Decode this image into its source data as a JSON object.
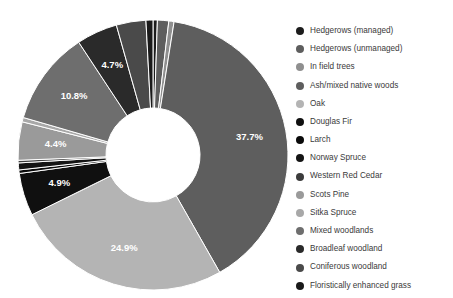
{
  "chart_data": {
    "type": "pie",
    "variant": "donut",
    "title": "",
    "subtitle": "",
    "xlabel": "",
    "ylabel": "",
    "grid": false,
    "legend_position": "right",
    "start_angle_deg": 0,
    "direction": "clockwise",
    "inner_radius_ratio": 0.35,
    "units": "percent",
    "total": 100.0,
    "categories": [
      "Hedgerows (managed)",
      "Hedgerows (unmanaged)",
      "In field trees",
      "Ash/mixed native woods",
      "Oak",
      "Douglas Fir",
      "Larch",
      "Norway Spruce",
      "Western Red Cedar",
      "Scots Pine",
      "Sitka Spruce",
      "Mixed woodlands",
      "Broadleaf woodland",
      "Coniferous woodland",
      "Floristically enhanced grass"
    ],
    "values": [
      0.5,
      1.3,
      0.6,
      37.7,
      24.9,
      4.9,
      0.4,
      0.8,
      0.3,
      4.4,
      0.5,
      10.8,
      4.7,
      3.4,
      0.8
    ],
    "colors": [
      "#1c1c1c",
      "#5e5e5e",
      "#8f8f8f",
      "#5e5e5e",
      "#b4b4b4",
      "#101010",
      "#0a0a0a",
      "#141414",
      "#3c3c3c",
      "#9a9a9a",
      "#a8a8a8",
      "#6e6e6e",
      "#2a2a2a",
      "#4a4a4a",
      "#1a1a1a"
    ],
    "visible_data_labels": [
      {
        "label": "37.7%",
        "value": 37.7,
        "category": "Ash/mixed native woods"
      },
      {
        "label": "24.9%",
        "value": 24.9,
        "category": "Oak"
      },
      {
        "label": "4.9%",
        "value": 4.9,
        "category": "Douglas Fir"
      },
      {
        "label": "4.4%",
        "value": 4.4,
        "category": "Scots Pine"
      },
      {
        "label": "10.8%",
        "value": 10.8,
        "category": "Mixed woodlands"
      },
      {
        "label": "4.7%",
        "value": 4.7,
        "category": "Broadleaf woodland"
      }
    ]
  },
  "legend": {
    "items": [
      {
        "label": "Hedgerows (managed)",
        "color": "#1c1c1c"
      },
      {
        "label": "Hedgerows (unmanaged)",
        "color": "#5e5e5e"
      },
      {
        "label": "In field trees",
        "color": "#8f8f8f"
      },
      {
        "label": "Ash/mixed native woods",
        "color": "#5e5e5e"
      },
      {
        "label": "Oak",
        "color": "#b4b4b4"
      },
      {
        "label": "Douglas Fir",
        "color": "#101010"
      },
      {
        "label": "Larch",
        "color": "#0a0a0a"
      },
      {
        "label": "Norway Spruce",
        "color": "#141414"
      },
      {
        "label": "Western Red Cedar",
        "color": "#3c3c3c"
      },
      {
        "label": "Scots Pine",
        "color": "#9a9a9a"
      },
      {
        "label": "Sitka Spruce",
        "color": "#a8a8a8"
      },
      {
        "label": "Mixed woodlands",
        "color": "#6e6e6e"
      },
      {
        "label": "Broadleaf woodland",
        "color": "#2a2a2a"
      },
      {
        "label": "Coniferous woodland",
        "color": "#4a4a4a"
      },
      {
        "label": "Floristically enhanced grass",
        "color": "#1a1a1a"
      }
    ]
  },
  "geometry": {
    "center_x": 153,
    "center_y": 155,
    "outer_radius": 135,
    "inner_radius": 47,
    "label_radius": 98,
    "background": "#ffffff"
  }
}
